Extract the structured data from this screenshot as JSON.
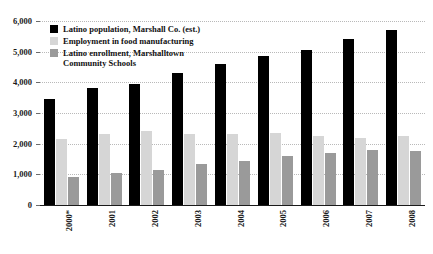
{
  "chart_data": {
    "type": "bar",
    "title": "",
    "xlabel": "",
    "ylabel": "",
    "ylim": [
      0,
      6000
    ],
    "ytick_values": [
      0,
      1000,
      2000,
      3000,
      4000,
      5000,
      6000
    ],
    "ytick_labels": [
      "0",
      "1,000",
      "2,000",
      "3,000",
      "4,000",
      "5,000",
      "6,000"
    ],
    "grid": true,
    "legend_position": "upper-left-inside",
    "categories": [
      "2000*",
      "2001",
      "2002",
      "2003",
      "2004",
      "2005",
      "2006",
      "2007",
      "2008"
    ],
    "series": [
      {
        "name": "Latino population, Marshall Co. (est.)",
        "color": "#000000",
        "values": [
          3450,
          3800,
          3950,
          4300,
          4600,
          4850,
          5050,
          5400,
          5700
        ]
      },
      {
        "name": "Employment in food manufacturing",
        "color": "#d6d6d6",
        "values": [
          2150,
          2300,
          2400,
          2300,
          2300,
          2350,
          2250,
          2200,
          2250
        ]
      },
      {
        "name": "Latino enrollment, Marshalltown\nCommunity Schools",
        "color": "#9a9a9a",
        "values": [
          900,
          1050,
          1150,
          1350,
          1450,
          1600,
          1700,
          1800,
          1750
        ]
      }
    ],
    "footnote_marker": "*"
  }
}
